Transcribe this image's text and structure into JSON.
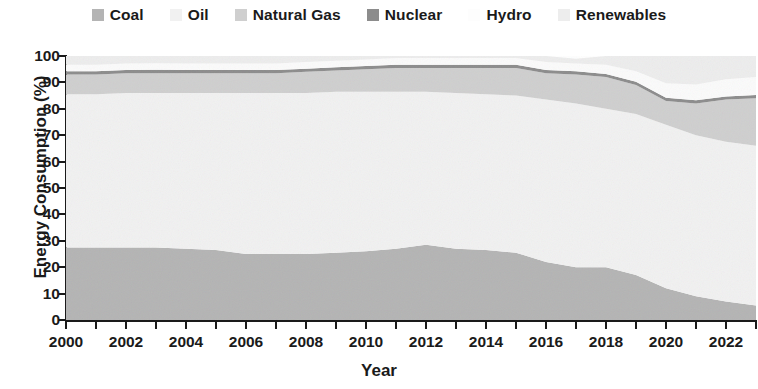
{
  "chart_data": {
    "type": "area",
    "stacked": true,
    "title": "",
    "xlabel": "Year",
    "ylabel": "Energy Consumption (%)",
    "xlim": [
      2000,
      2023
    ],
    "ylim": [
      0,
      100
    ],
    "grid": false,
    "legend_position": "top-center",
    "x": [
      2000,
      2001,
      2002,
      2003,
      2004,
      2005,
      2006,
      2007,
      2008,
      2009,
      2010,
      2011,
      2012,
      2013,
      2014,
      2015,
      2016,
      2017,
      2018,
      2019,
      2020,
      2021,
      2022,
      2023
    ],
    "xticks": [
      2000,
      2002,
      2004,
      2006,
      2008,
      2010,
      2012,
      2014,
      2016,
      2018,
      2020,
      2022
    ],
    "xticklabels": [
      "2000",
      "2002",
      "2004",
      "2006",
      "2008",
      "2010",
      "2012",
      "2014",
      "2016",
      "2018",
      "2020",
      "2022"
    ],
    "xticks_all": [
      2000,
      2001,
      2002,
      2003,
      2004,
      2005,
      2006,
      2007,
      2008,
      2009,
      2010,
      2011,
      2012,
      2013,
      2014,
      2015,
      2016,
      2017,
      2018,
      2019,
      2020,
      2021,
      2022,
      2023
    ],
    "yticks": [
      0,
      10,
      20,
      30,
      40,
      50,
      60,
      70,
      80,
      90,
      100
    ],
    "yticklabels": [
      "0",
      "10",
      "20",
      "30",
      "40",
      "50",
      "60",
      "70",
      "80",
      "90",
      "100"
    ],
    "series": [
      {
        "name": "Coal",
        "color": "#b4b4b4",
        "values": [
          27.5,
          27.5,
          27.5,
          27.5,
          27.0,
          26.5,
          25.0,
          25.0,
          25.0,
          25.5,
          26.0,
          27.0,
          28.5,
          27.0,
          26.5,
          25.5,
          22.0,
          20.0,
          20.0,
          17.0,
          12.0,
          9.0,
          7.0,
          5.5
        ]
      },
      {
        "name": "Oil",
        "color": "#f1f1f1",
        "values": [
          58.0,
          58.0,
          58.5,
          58.5,
          59.0,
          59.5,
          61.0,
          61.0,
          61.0,
          61.0,
          60.5,
          59.5,
          58.0,
          59.0,
          59.0,
          59.5,
          61.5,
          62.0,
          60.0,
          61.0,
          62.0,
          61.0,
          60.5,
          60.5
        ]
      },
      {
        "name": "Natural Gas",
        "color": "#cfcfcf",
        "values": [
          7.5,
          7.5,
          7.5,
          7.5,
          7.5,
          7.5,
          7.5,
          7.5,
          8.0,
          8.0,
          8.5,
          9.0,
          9.0,
          9.5,
          10.0,
          10.5,
          10.0,
          11.0,
          12.0,
          11.0,
          9.0,
          12.0,
          16.0,
          18.0
        ]
      },
      {
        "name": "Nuclear",
        "color": "#8c8c8c",
        "values": [
          1.2,
          1.2,
          1.2,
          1.3,
          1.2,
          1.2,
          1.2,
          1.2,
          1.2,
          1.2,
          1.2,
          1.2,
          1.2,
          1.2,
          1.2,
          1.2,
          1.2,
          1.2,
          1.2,
          1.2,
          1.2,
          1.2,
          1.2,
          1.2
        ]
      },
      {
        "name": "Hydro",
        "color": "#fbfbfb",
        "values": [
          2.5,
          2.5,
          2.5,
          2.5,
          2.5,
          2.5,
          2.5,
          2.5,
          2.5,
          2.5,
          2.5,
          2.5,
          2.5,
          2.5,
          2.5,
          2.5,
          3.0,
          3.0,
          3.5,
          4.0,
          5.5,
          6.0,
          6.5,
          6.8
        ]
      },
      {
        "name": "Renewables",
        "color": "#ededed",
        "values": [
          3.3,
          3.3,
          2.8,
          2.7,
          2.8,
          2.8,
          2.8,
          2.8,
          2.3,
          1.8,
          1.3,
          0.8,
          0.8,
          0.8,
          0.8,
          0.8,
          2.3,
          1.8,
          3.3,
          5.8,
          10.3,
          10.8,
          8.8,
          8.0
        ]
      }
    ]
  },
  "legend": {
    "items": [
      {
        "label": "Coal",
        "color": "#b4b4b4"
      },
      {
        "label": "Oil",
        "color": "#f1f1f1"
      },
      {
        "label": "Natural Gas",
        "color": "#cfcfcf"
      },
      {
        "label": "Nuclear",
        "color": "#8c8c8c"
      },
      {
        "label": "Hydro",
        "color": "#fdfdfd"
      },
      {
        "label": "Renewables",
        "color": "#ededed"
      }
    ]
  },
  "axes": {
    "y_title": "Energy Consumption (%)",
    "x_title": "Year"
  }
}
